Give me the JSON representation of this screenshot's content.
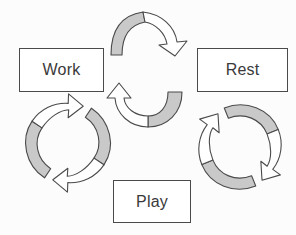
{
  "diagram": {
    "type": "cycle-diagram",
    "background_color": "#fcfcfc",
    "stroke_color": "#4a4a4a",
    "arrow_fill_gray": "#c9c9c9",
    "arrow_fill_white": "#ffffff",
    "label_color": "#3a3a3a",
    "nodes": [
      {
        "id": "work",
        "label": "Work"
      },
      {
        "id": "rest",
        "label": "Rest"
      },
      {
        "id": "play",
        "label": "Play"
      }
    ],
    "connectors": [
      {
        "id": "top-arrow",
        "name": "work-to-rest-arrow",
        "direction": "clockwise",
        "from": "work",
        "to": "rest"
      },
      {
        "id": "center-arrow",
        "name": "center-return-arrow",
        "direction": "counter-clockwise",
        "from": "rest",
        "to": "work"
      },
      {
        "id": "left-cycle",
        "name": "work-play-cycle-arrows",
        "direction": "clockwise",
        "from": "work",
        "to": "play"
      },
      {
        "id": "right-cycle",
        "name": "rest-play-cycle-arrows",
        "direction": "clockwise",
        "from": "rest",
        "to": "play"
      }
    ]
  }
}
